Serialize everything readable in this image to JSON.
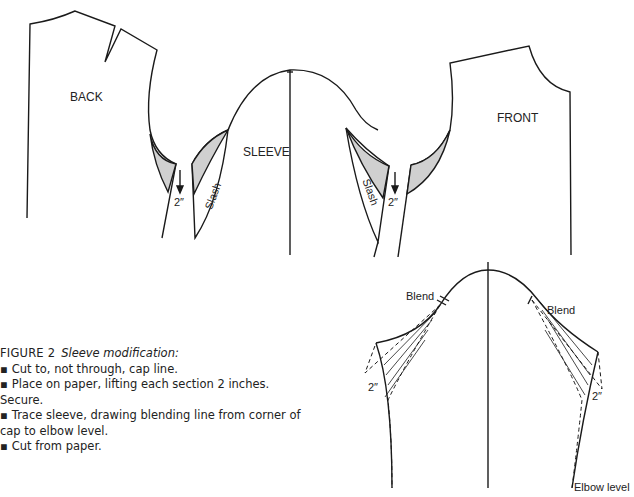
{
  "figure": {
    "number": "FIGURE 2",
    "title": "Sleeve modification:",
    "steps": [
      "Cut to, not through, cap line.",
      "Place on paper, lifting each section 2 inches.",
      "Secure.",
      "Trace sleeve, drawing blending line from corner of",
      "cap to elbow level.",
      "Cut from paper."
    ]
  },
  "labels": {
    "back": "BACK",
    "sleeve": "SLEEVE",
    "front": "FRONT",
    "slash_left": "Slash",
    "slash_right": "Slash",
    "lift_left": "2″",
    "lift_right": "2″",
    "blend_left": "Blend",
    "blend_right": "Blend",
    "lower_lift_left": "2″",
    "lower_lift_right": "2″",
    "elbow": "Elbow level"
  },
  "colors": {
    "line": "#1a1a1a",
    "shade": "#d0d0d0"
  }
}
